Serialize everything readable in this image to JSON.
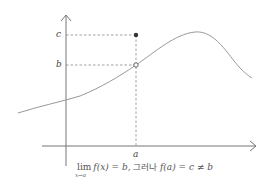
{
  "diagram": {
    "colors": {
      "axis": "#777777",
      "curve": "#999999",
      "dashed": "#888888",
      "filled_point": "#333333",
      "open_point_fill": "#ffffff",
      "text": "#444444"
    },
    "axes": {
      "x_axis": {
        "x1": 42,
        "x2": 256,
        "y": 146
      },
      "y_axis": {
        "x": 66,
        "y1": 166,
        "y2": 15
      }
    },
    "labels": {
      "c": "c",
      "b": "b",
      "a": "a"
    },
    "points": {
      "filled": {
        "label": "(a, c)",
        "x": 136,
        "y": 35
      },
      "open": {
        "label": "(a, b)",
        "x": 136,
        "y": 65
      }
    },
    "curve": {
      "description": "smooth curve rising through (a,b) to a peak then falling",
      "path": "M18,113 C40,106 60,102 80,96 C100,88 120,76 136,65 C155,52 175,34 195,32 C215,30 228,55 240,68 C245,73 250,77 252,78"
    },
    "formula": {
      "lim": "lim",
      "lim_sub": "x→a",
      "part1": "f(x) = b,",
      "conj": " 그러나 ",
      "part2": "f(a) = c ≠ b"
    }
  }
}
